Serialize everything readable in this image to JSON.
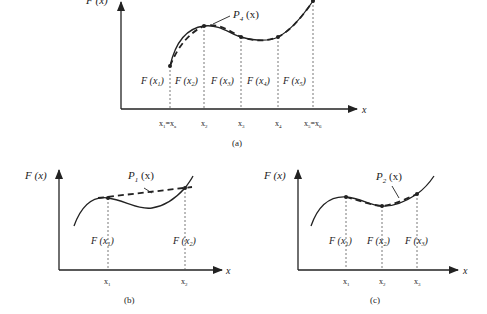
{
  "figure": {
    "panels": [
      {
        "id": "a",
        "caption": "(a)",
        "y_axis_label": "F (x)",
        "x_axis_label": "x",
        "curve_label": "P4 (x)",
        "curve_label_main": "P",
        "curve_label_sub": "4",
        "curve_label_arg": "(x)",
        "nodes": [
          {
            "x_label": "x1=xa",
            "f_label": "F (x1)"
          },
          {
            "x_label": "x2",
            "f_label": "F (x2)"
          },
          {
            "x_label": "x3",
            "f_label": "F (x3)"
          },
          {
            "x_label": "x4",
            "f_label": "F (x4)"
          },
          {
            "x_label": "x5=x6",
            "f_label": "F (x5)"
          }
        ]
      },
      {
        "id": "b",
        "caption": "(b)",
        "y_axis_label": "F (x)",
        "x_axis_label": "x",
        "curve_label": "P1 (x)",
        "curve_label_main": "P",
        "curve_label_sub": "1",
        "curve_label_arg": "(x)",
        "nodes": [
          {
            "x_label": "x1",
            "f_label": "F (x1)"
          },
          {
            "x_label": "x2",
            "f_label": "F (x2)"
          }
        ]
      },
      {
        "id": "c",
        "caption": "(c)",
        "y_axis_label": "F (x)",
        "x_axis_label": "x",
        "curve_label": "P2 (x)",
        "curve_label_main": "P",
        "curve_label_sub": "2",
        "curve_label_arg": "(x)",
        "nodes": [
          {
            "x_label": "x1",
            "f_label": "F (x1)"
          },
          {
            "x_label": "x2",
            "f_label": "F (x2)"
          },
          {
            "x_label": "x3",
            "f_label": "F (x3)"
          }
        ]
      }
    ],
    "colors": {
      "ink": "#222222",
      "background": "#ffffff"
    }
  }
}
